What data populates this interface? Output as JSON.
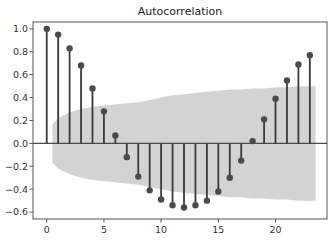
{
  "chart_data": {
    "type": "stem",
    "title": "Autocorrelation",
    "xlabel": "",
    "ylabel": "",
    "x": [
      0,
      1,
      2,
      3,
      4,
      5,
      6,
      7,
      8,
      9,
      10,
      11,
      12,
      13,
      14,
      15,
      16,
      17,
      18,
      19,
      20,
      21,
      22,
      23
    ],
    "values": [
      1.0,
      0.95,
      0.83,
      0.68,
      0.48,
      0.28,
      0.07,
      -0.12,
      -0.29,
      -0.41,
      -0.49,
      -0.54,
      -0.56,
      -0.54,
      -0.5,
      -0.42,
      -0.3,
      -0.15,
      0.02,
      0.21,
      0.39,
      0.55,
      0.69,
      0.77
    ],
    "confidence_band": {
      "x": [
        0.5,
        1,
        2,
        3,
        4,
        5,
        6,
        7,
        8,
        9,
        10,
        11,
        12,
        13,
        14,
        15,
        16,
        17,
        18,
        19,
        20,
        21,
        22,
        23,
        23.5
      ],
      "upper": [
        0.17,
        0.22,
        0.27,
        0.3,
        0.32,
        0.33,
        0.34,
        0.35,
        0.36,
        0.38,
        0.4,
        0.42,
        0.43,
        0.44,
        0.45,
        0.46,
        0.47,
        0.47,
        0.48,
        0.48,
        0.49,
        0.49,
        0.5,
        0.5,
        0.5
      ]
    },
    "xlim": [
      -1.2,
      24.5
    ],
    "ylim": [
      -0.66,
      1.06
    ],
    "xticks": [
      0,
      5,
      10,
      15,
      20
    ],
    "xtick_labels": [
      "0",
      "5",
      "10",
      "15",
      "20"
    ],
    "yticks": [
      -0.6,
      -0.4,
      -0.2,
      0.0,
      0.2,
      0.4,
      0.6,
      0.8,
      1.0
    ],
    "ytick_labels": [
      "−0.6",
      "−0.4",
      "−0.2",
      "0.0",
      "0.2",
      "0.4",
      "0.6",
      "0.8",
      "1.0"
    ],
    "grid": false,
    "legend": null,
    "colors": {
      "stem": "#3a3a3a",
      "marker": "#4a4a4a",
      "band": "#d3d3d3",
      "zero_line": "#4a4a4a",
      "frame": "#555555"
    }
  }
}
